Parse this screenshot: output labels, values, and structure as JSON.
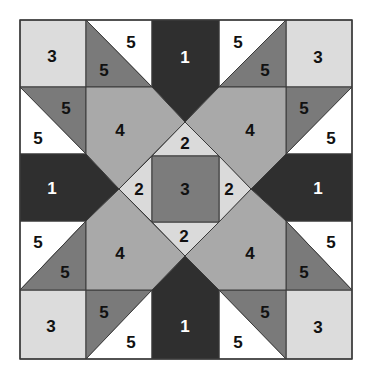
{
  "diagram": {
    "colors": {
      "1": "#2f2f2f",
      "2": "#dadada",
      "3_corner": "#dcdcdc",
      "3_center": "#7c7c7c",
      "4": "#a9a9a9",
      "5_dark": "#7a7a7a",
      "5_light": "#ffffff",
      "border": "#3a3a3a",
      "text_dark": "#111111",
      "text_light": "#ffffff"
    },
    "grid": {
      "x": [
        20,
        86,
        152,
        219,
        286,
        352
      ],
      "y": [
        20,
        87,
        154,
        221,
        290,
        359
      ],
      "center": [
        185,
        189
      ],
      "diamond_half": 66
    },
    "pieces": [
      {
        "id": "corner-tl",
        "label": "3",
        "fill": "3_corner",
        "text": "text_dark",
        "points": [
          [
            20,
            20
          ],
          [
            86,
            20
          ],
          [
            86,
            87
          ],
          [
            20,
            87
          ]
        ],
        "lx": 52,
        "ly": 56
      },
      {
        "id": "corner-tr",
        "label": "3",
        "fill": "3_corner",
        "text": "text_dark",
        "points": [
          [
            286,
            20
          ],
          [
            352,
            20
          ],
          [
            352,
            87
          ],
          [
            286,
            87
          ]
        ],
        "lx": 318,
        "ly": 57
      },
      {
        "id": "corner-bl",
        "label": "3",
        "fill": "3_corner",
        "text": "text_dark",
        "points": [
          [
            20,
            290
          ],
          [
            86,
            290
          ],
          [
            86,
            359
          ],
          [
            20,
            359
          ]
        ],
        "lx": 51,
        "ly": 326
      },
      {
        "id": "corner-br",
        "label": "3",
        "fill": "3_corner",
        "text": "text_dark",
        "points": [
          [
            286,
            290
          ],
          [
            352,
            290
          ],
          [
            352,
            359
          ],
          [
            286,
            359
          ]
        ],
        "lx": 318,
        "ly": 327
      },
      {
        "id": "hst-r0c1-light",
        "label": "5",
        "fill": "5_light",
        "text": "text_dark",
        "points": [
          [
            86,
            20
          ],
          [
            152,
            20
          ],
          [
            152,
            87
          ]
        ],
        "lx": 131,
        "ly": 42
      },
      {
        "id": "hst-r0c1-dark",
        "label": "5",
        "fill": "5_dark",
        "text": "text_dark",
        "points": [
          [
            86,
            20
          ],
          [
            152,
            87
          ],
          [
            86,
            87
          ]
        ],
        "lx": 104,
        "ly": 70
      },
      {
        "id": "hst-r0c3-light",
        "label": "5",
        "fill": "5_light",
        "text": "text_dark",
        "points": [
          [
            219,
            20
          ],
          [
            286,
            20
          ],
          [
            219,
            87
          ]
        ],
        "lx": 238,
        "ly": 42
      },
      {
        "id": "hst-r0c3-dark",
        "label": "5",
        "fill": "5_dark",
        "text": "text_dark",
        "points": [
          [
            286,
            20
          ],
          [
            286,
            87
          ],
          [
            219,
            87
          ]
        ],
        "lx": 265,
        "ly": 70
      },
      {
        "id": "hst-r1c0-dark",
        "label": "5",
        "fill": "5_dark",
        "text": "text_dark",
        "points": [
          [
            20,
            87
          ],
          [
            86,
            87
          ],
          [
            86,
            154
          ]
        ],
        "lx": 66,
        "ly": 108
      },
      {
        "id": "hst-r1c0-light",
        "label": "5",
        "fill": "5_light",
        "text": "text_dark",
        "points": [
          [
            20,
            87
          ],
          [
            86,
            154
          ],
          [
            20,
            154
          ]
        ],
        "lx": 38,
        "ly": 138
      },
      {
        "id": "hst-r1c4-dark",
        "label": "5",
        "fill": "5_dark",
        "text": "text_dark",
        "points": [
          [
            286,
            87
          ],
          [
            352,
            87
          ],
          [
            286,
            154
          ]
        ],
        "lx": 304,
        "ly": 108
      },
      {
        "id": "hst-r1c4-light",
        "label": "5",
        "fill": "5_light",
        "text": "text_dark",
        "points": [
          [
            352,
            87
          ],
          [
            352,
            154
          ],
          [
            286,
            154
          ]
        ],
        "lx": 331,
        "ly": 138
      },
      {
        "id": "hst-r3c0-light",
        "label": "5",
        "fill": "5_light",
        "text": "text_dark",
        "points": [
          [
            20,
            221
          ],
          [
            86,
            221
          ],
          [
            20,
            290
          ]
        ],
        "lx": 38,
        "ly": 242
      },
      {
        "id": "hst-r3c0-dark",
        "label": "5",
        "fill": "5_dark",
        "text": "text_dark",
        "points": [
          [
            86,
            221
          ],
          [
            86,
            290
          ],
          [
            20,
            290
          ]
        ],
        "lx": 65,
        "ly": 272
      },
      {
        "id": "hst-r3c4-light",
        "label": "5",
        "fill": "5_light",
        "text": "text_dark",
        "points": [
          [
            286,
            221
          ],
          [
            352,
            221
          ],
          [
            352,
            290
          ]
        ],
        "lx": 331,
        "ly": 242
      },
      {
        "id": "hst-r3c4-dark",
        "label": "5",
        "fill": "5_dark",
        "text": "text_dark",
        "points": [
          [
            286,
            221
          ],
          [
            352,
            290
          ],
          [
            286,
            290
          ]
        ],
        "lx": 304,
        "ly": 272
      },
      {
        "id": "hst-r4c1-dark",
        "label": "5",
        "fill": "5_dark",
        "text": "text_dark",
        "points": [
          [
            86,
            290
          ],
          [
            152,
            290
          ],
          [
            86,
            359
          ]
        ],
        "lx": 104,
        "ly": 312
      },
      {
        "id": "hst-r4c1-light",
        "label": "5",
        "fill": "5_light",
        "text": "text_dark",
        "points": [
          [
            152,
            290
          ],
          [
            152,
            359
          ],
          [
            86,
            359
          ]
        ],
        "lx": 131,
        "ly": 342
      },
      {
        "id": "hst-r4c3-dark",
        "label": "5",
        "fill": "5_dark",
        "text": "text_dark",
        "points": [
          [
            219,
            290
          ],
          [
            286,
            290
          ],
          [
            286,
            359
          ]
        ],
        "lx": 265,
        "ly": 312
      },
      {
        "id": "hst-r4c3-light",
        "label": "5",
        "fill": "5_light",
        "text": "text_dark",
        "points": [
          [
            219,
            290
          ],
          [
            286,
            359
          ],
          [
            219,
            359
          ]
        ],
        "lx": 238,
        "ly": 342
      },
      {
        "id": "dark-top",
        "label": "1",
        "fill": "1",
        "text": "text_light",
        "points": [
          [
            152,
            20
          ],
          [
            219,
            20
          ],
          [
            219,
            87
          ],
          [
            185,
            122
          ],
          [
            152,
            87
          ]
        ],
        "lx": 185,
        "ly": 57
      },
      {
        "id": "dark-bottom",
        "label": "1",
        "fill": "1",
        "text": "text_light",
        "points": [
          [
            152,
            290
          ],
          [
            185,
            256
          ],
          [
            219,
            290
          ],
          [
            219,
            359
          ],
          [
            152,
            359
          ]
        ],
        "lx": 185,
        "ly": 326
      },
      {
        "id": "dark-left",
        "label": "1",
        "fill": "1",
        "text": "text_light",
        "points": [
          [
            20,
            154
          ],
          [
            86,
            154
          ],
          [
            119,
            189
          ],
          [
            86,
            221
          ],
          [
            20,
            221
          ]
        ],
        "lx": 52,
        "ly": 188
      },
      {
        "id": "dark-right",
        "label": "1",
        "fill": "1",
        "text": "text_light",
        "points": [
          [
            286,
            154
          ],
          [
            352,
            154
          ],
          [
            352,
            221
          ],
          [
            286,
            221
          ],
          [
            251,
            189
          ]
        ],
        "lx": 318,
        "ly": 188
      },
      {
        "id": "large-tl",
        "label": "4",
        "fill": "4",
        "text": "text_dark",
        "points": [
          [
            86,
            87
          ],
          [
            152,
            87
          ],
          [
            185,
            122
          ],
          [
            119,
            189
          ],
          [
            86,
            154
          ]
        ],
        "lx": 120,
        "ly": 130
      },
      {
        "id": "large-tr",
        "label": "4",
        "fill": "4",
        "text": "text_dark",
        "points": [
          [
            219,
            87
          ],
          [
            286,
            87
          ],
          [
            286,
            154
          ],
          [
            251,
            189
          ],
          [
            185,
            122
          ]
        ],
        "lx": 250,
        "ly": 130
      },
      {
        "id": "large-bl",
        "label": "4",
        "fill": "4",
        "text": "text_dark",
        "points": [
          [
            86,
            221
          ],
          [
            119,
            189
          ],
          [
            185,
            256
          ],
          [
            152,
            290
          ],
          [
            86,
            290
          ]
        ],
        "lx": 120,
        "ly": 253
      },
      {
        "id": "large-br",
        "label": "4",
        "fill": "4",
        "text": "text_dark",
        "points": [
          [
            251,
            189
          ],
          [
            286,
            221
          ],
          [
            286,
            290
          ],
          [
            219,
            290
          ],
          [
            185,
            256
          ]
        ],
        "lx": 250,
        "ly": 253
      },
      {
        "id": "tri-top",
        "label": "2",
        "fill": "2",
        "text": "text_dark",
        "points": [
          [
            185,
            122
          ],
          [
            219,
            156
          ],
          [
            152,
            156
          ]
        ],
        "lx": 185,
        "ly": 143
      },
      {
        "id": "tri-right",
        "label": "2",
        "fill": "2",
        "text": "text_dark",
        "points": [
          [
            219,
            156
          ],
          [
            251,
            189
          ],
          [
            219,
            222
          ]
        ],
        "lx": 229,
        "ly": 189
      },
      {
        "id": "tri-bottom",
        "label": "2",
        "fill": "2",
        "text": "text_dark",
        "points": [
          [
            152,
            222
          ],
          [
            219,
            222
          ],
          [
            185,
            256
          ]
        ],
        "lx": 184,
        "ly": 236
      },
      {
        "id": "tri-left",
        "label": "2",
        "fill": "2",
        "text": "text_dark",
        "points": [
          [
            152,
            156
          ],
          [
            152,
            222
          ],
          [
            119,
            189
          ]
        ],
        "lx": 139,
        "ly": 189
      },
      {
        "id": "center-square",
        "label": "3",
        "fill": "3_center",
        "text": "text_dark",
        "points": [
          [
            152,
            156
          ],
          [
            219,
            156
          ],
          [
            219,
            222
          ],
          [
            152,
            222
          ]
        ],
        "lx": 185,
        "ly": 189
      }
    ]
  }
}
